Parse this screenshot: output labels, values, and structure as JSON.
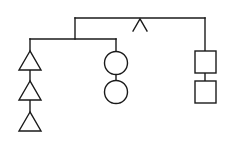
{
  "diagram": {
    "type": "hanging-mobile-balance",
    "colors": {
      "stroke": "#1a1a1a",
      "background": "#ffffff"
    },
    "top_beam": {
      "fulcrum": "caret-shaped pivot"
    },
    "sub_beam": {
      "side": "left"
    },
    "groups": [
      {
        "name": "triangles",
        "shape": "triangle",
        "count": 3,
        "hangs_from": "sub-beam left end"
      },
      {
        "name": "circles",
        "shape": "circle",
        "count": 2,
        "hangs_from": "sub-beam right end"
      },
      {
        "name": "squares",
        "shape": "square",
        "count": 2,
        "hangs_from": "top-beam right end"
      }
    ]
  }
}
